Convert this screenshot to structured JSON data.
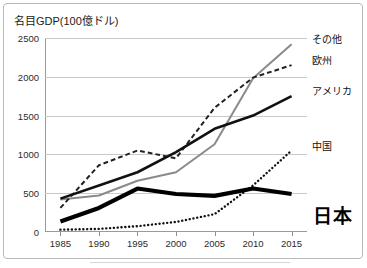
{
  "figure": {
    "title": "名目GDP(100億ドル)",
    "frame_color": "#b9b9b9",
    "background": "#ffffff"
  },
  "axes": {
    "y_ticks": [
      "0",
      "500",
      "1000",
      "1500",
      "2000",
      "2500"
    ],
    "x_ticks": [
      "1985",
      "1990",
      "1995",
      "2000",
      "2005",
      "2010",
      "2015"
    ]
  },
  "series_labels": {
    "other": "その他",
    "europe": "欧州",
    "america": "アメリカ",
    "china": "中国",
    "japan": "日本"
  },
  "chart_data": {
    "type": "line",
    "title": "名目GDP(100億ドル)",
    "xlabel": "",
    "ylabel": "名目GDP(100億ドル)",
    "x": [
      1985,
      1990,
      1995,
      2000,
      2005,
      2010,
      2015
    ],
    "xlim": [
      1983,
      2017
    ],
    "ylim": [
      0,
      2500
    ],
    "yticks": [
      0,
      500,
      1000,
      1500,
      2000,
      2500
    ],
    "grid": "horizontal",
    "legend": "inline-right-labels",
    "series": [
      {
        "name": "その他",
        "style": "solid",
        "color": "#8a8a8a",
        "width": 2.0,
        "label_value": 2420,
        "values": [
          420,
          470,
          660,
          770,
          1130,
          1980,
          2420
        ]
      },
      {
        "name": "欧州",
        "style": "dashed",
        "color": "#222222",
        "width": 2.0,
        "label_value": 2150,
        "values": [
          310,
          860,
          1050,
          950,
          1600,
          1990,
          2150
        ]
      },
      {
        "name": "アメリカ",
        "style": "solid",
        "color": "#111111",
        "width": 2.6,
        "label_value": 1750,
        "values": [
          430,
          600,
          770,
          1030,
          1330,
          1500,
          1750
        ]
      },
      {
        "name": "中国",
        "style": "dotted",
        "color": "#111111",
        "width": 2.4,
        "label_value": 1050,
        "values": [
          30,
          40,
          75,
          130,
          230,
          600,
          1050
        ]
      },
      {
        "name": "日本",
        "style": "solid",
        "color": "#000000",
        "width": 4.2,
        "label_value": 490,
        "values": [
          135,
          310,
          560,
          490,
          465,
          560,
          490
        ]
      }
    ]
  }
}
